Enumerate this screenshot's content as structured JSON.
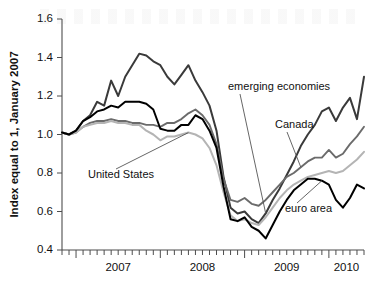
{
  "chart_data": {
    "type": "line",
    "title": "",
    "subtitle": "",
    "xlabel": "",
    "ylabel": "Index equal to 1, January 2007",
    "ylim": [
      0.4,
      1.6
    ],
    "yticks": [
      0.4,
      0.6,
      0.8,
      1.0,
      1.2,
      1.4,
      1.6
    ],
    "ytick_labels": [
      "0.4",
      "0.6",
      "0.8",
      "1.0",
      "1.2",
      "1.4",
      "1.6"
    ],
    "xlim": [
      "2006-11",
      "2010-07"
    ],
    "xtick_labels": [
      "2007",
      "2008",
      "2009",
      "2010"
    ],
    "x_minor_ticks": "monthly",
    "grid": false,
    "legend_position": "inline-annotations",
    "x": [
      "2006-11",
      "2006-12",
      "2007-01",
      "2007-02",
      "2007-03",
      "2007-04",
      "2007-05",
      "2007-06",
      "2007-07",
      "2007-08",
      "2007-09",
      "2007-10",
      "2007-11",
      "2007-12",
      "2008-01",
      "2008-02",
      "2008-03",
      "2008-04",
      "2008-05",
      "2008-06",
      "2008-07",
      "2008-08",
      "2008-09",
      "2008-10",
      "2008-11",
      "2008-12",
      "2009-01",
      "2009-02",
      "2009-03",
      "2009-04",
      "2009-05",
      "2009-06",
      "2009-07",
      "2009-08",
      "2009-09",
      "2009-10",
      "2009-11",
      "2009-12",
      "2010-01",
      "2010-02",
      "2010-03",
      "2010-04",
      "2010-05",
      "2010-06"
    ],
    "series": [
      {
        "name": "emerging economies",
        "color": "#3a3a3a",
        "width": 2.0,
        "label_x": "2009-02",
        "values": [
          1.01,
          1.0,
          1.02,
          1.07,
          1.1,
          1.17,
          1.15,
          1.28,
          1.2,
          1.3,
          1.36,
          1.42,
          1.41,
          1.38,
          1.36,
          1.3,
          1.26,
          1.31,
          1.36,
          1.28,
          1.22,
          1.15,
          1.02,
          0.78,
          0.62,
          0.59,
          0.6,
          0.56,
          0.54,
          0.59,
          0.66,
          0.72,
          0.79,
          0.86,
          0.94,
          1.0,
          1.05,
          1.12,
          1.14,
          1.07,
          1.14,
          1.19,
          1.08,
          1.3
        ]
      },
      {
        "name": "Canada",
        "color": "#6b6b6b",
        "width": 1.9,
        "label_x": "2009-07",
        "values": [
          1.01,
          1.0,
          1.01,
          1.04,
          1.06,
          1.07,
          1.07,
          1.08,
          1.07,
          1.07,
          1.06,
          1.06,
          1.05,
          1.05,
          1.04,
          1.06,
          1.06,
          1.08,
          1.11,
          1.13,
          1.1,
          1.05,
          0.95,
          0.77,
          0.66,
          0.65,
          0.67,
          0.64,
          0.63,
          0.66,
          0.7,
          0.74,
          0.78,
          0.8,
          0.83,
          0.86,
          0.88,
          0.88,
          0.92,
          0.88,
          0.9,
          0.95,
          0.99,
          1.04
        ]
      },
      {
        "name": "United States",
        "color": "#b4b4b4",
        "width": 2.0,
        "label_x": "2008-02",
        "values": [
          1.01,
          1.0,
          1.01,
          1.04,
          1.05,
          1.06,
          1.06,
          1.07,
          1.06,
          1.06,
          1.05,
          1.05,
          1.02,
          1.0,
          0.97,
          0.99,
          0.99,
          1.0,
          1.01,
          1.0,
          0.98,
          0.93,
          0.84,
          0.7,
          0.58,
          0.55,
          0.56,
          0.54,
          0.53,
          0.57,
          0.62,
          0.67,
          0.71,
          0.74,
          0.76,
          0.78,
          0.79,
          0.8,
          0.81,
          0.8,
          0.81,
          0.84,
          0.87,
          0.91
        ]
      },
      {
        "name": "euro area",
        "color": "#000000",
        "width": 2.0,
        "label_x": "2009-11",
        "values": [
          1.01,
          1.0,
          1.02,
          1.07,
          1.09,
          1.12,
          1.13,
          1.15,
          1.14,
          1.17,
          1.17,
          1.17,
          1.16,
          1.13,
          1.03,
          1.02,
          1.02,
          1.05,
          1.05,
          1.1,
          1.08,
          1.02,
          0.93,
          0.73,
          0.56,
          0.55,
          0.57,
          0.52,
          0.5,
          0.46,
          0.53,
          0.6,
          0.66,
          0.71,
          0.74,
          0.77,
          0.77,
          0.76,
          0.74,
          0.66,
          0.62,
          0.67,
          0.74,
          0.72
        ]
      }
    ],
    "annotations": [
      {
        "text": "emerging economies",
        "anchor": "series-emerging-economies"
      },
      {
        "text": "Canada",
        "anchor": "series-canada"
      },
      {
        "text": "United States",
        "anchor": "series-united-states"
      },
      {
        "text": "euro area",
        "anchor": "series-euro-area"
      }
    ]
  }
}
